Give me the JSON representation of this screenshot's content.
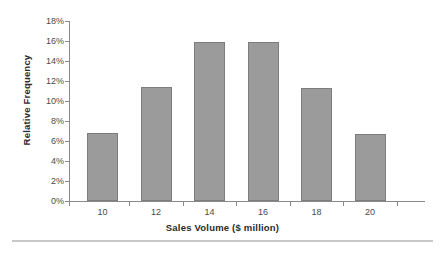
{
  "chart_data": {
    "type": "bar",
    "title": "",
    "xlabel": "Sales Volume ($ million)",
    "ylabel": "Relative Frequency",
    "categories": [
      "10",
      "12",
      "14",
      "16",
      "18",
      "20"
    ],
    "values": [
      6.8,
      11.4,
      15.9,
      15.9,
      11.3,
      6.7
    ],
    "value_suffix": "%",
    "ylim": [
      0,
      18
    ],
    "ytick_labels": [
      "0%",
      "2%",
      "4%",
      "6%",
      "8%",
      "10%",
      "12%",
      "14%",
      "16%",
      "18%"
    ],
    "ytick_values": [
      0,
      2,
      4,
      6,
      8,
      10,
      12,
      14,
      16,
      18
    ],
    "xtick_labels": [
      "10",
      "12",
      "14",
      "16",
      "18",
      "20"
    ],
    "grid": false,
    "legend": false,
    "legend_position": "none",
    "bar_color": "#9b9b9b",
    "bar_border_color": "#7d7d7d",
    "axis_color": "#8a8a8a",
    "text_color": "#4a4a4a",
    "title_color": "#2b2b2b",
    "background": "#ffffff"
  }
}
